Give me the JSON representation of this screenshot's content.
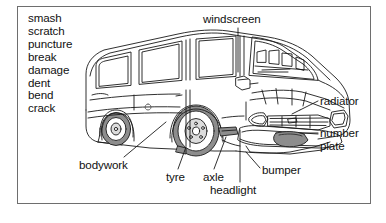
{
  "diagram": {
    "frame_color": "#6e6e6e",
    "background": "#ffffff",
    "line_color": "#1a1a1a",
    "shade_color": "#8d8d8d"
  },
  "word_list": {
    "name": "damage-verbs-list",
    "items": [
      {
        "label": "smash"
      },
      {
        "label": "scratch"
      },
      {
        "label": "puncture"
      },
      {
        "label": "break"
      },
      {
        "label": "damage"
      },
      {
        "label": "dent"
      },
      {
        "label": "bend"
      },
      {
        "label": "crack"
      }
    ]
  },
  "callouts": [
    {
      "key": "windscreen",
      "label": "windscreen",
      "anchor": "top"
    },
    {
      "key": "radiator",
      "label": "radiator",
      "anchor": "right"
    },
    {
      "key": "number_plate",
      "label_line1": "number",
      "label_line2": "plate",
      "anchor": "right"
    },
    {
      "key": "bodywork",
      "label": "bodywork",
      "anchor": "bottom-left"
    },
    {
      "key": "tyre",
      "label": "tyre",
      "anchor": "bottom"
    },
    {
      "key": "axle",
      "label": "axle",
      "anchor": "bottom"
    },
    {
      "key": "bumper",
      "label": "bumper",
      "anchor": "bottom-right"
    },
    {
      "key": "headlight",
      "label": "headlight",
      "anchor": "bottom"
    }
  ],
  "labels": {
    "windscreen": "windscreen",
    "radiator": "radiator",
    "number": "number",
    "plate": "plate",
    "bodywork": "bodywork",
    "tyre": "tyre",
    "axle": "axle",
    "bumper": "bumper",
    "headlight": "headlight"
  },
  "subject": {
    "name": "van",
    "view": "three-quarter front-left",
    "parts": [
      "windscreen",
      "radiator",
      "number plate",
      "bodywork",
      "tyre",
      "axle",
      "bumper",
      "headlight"
    ]
  }
}
